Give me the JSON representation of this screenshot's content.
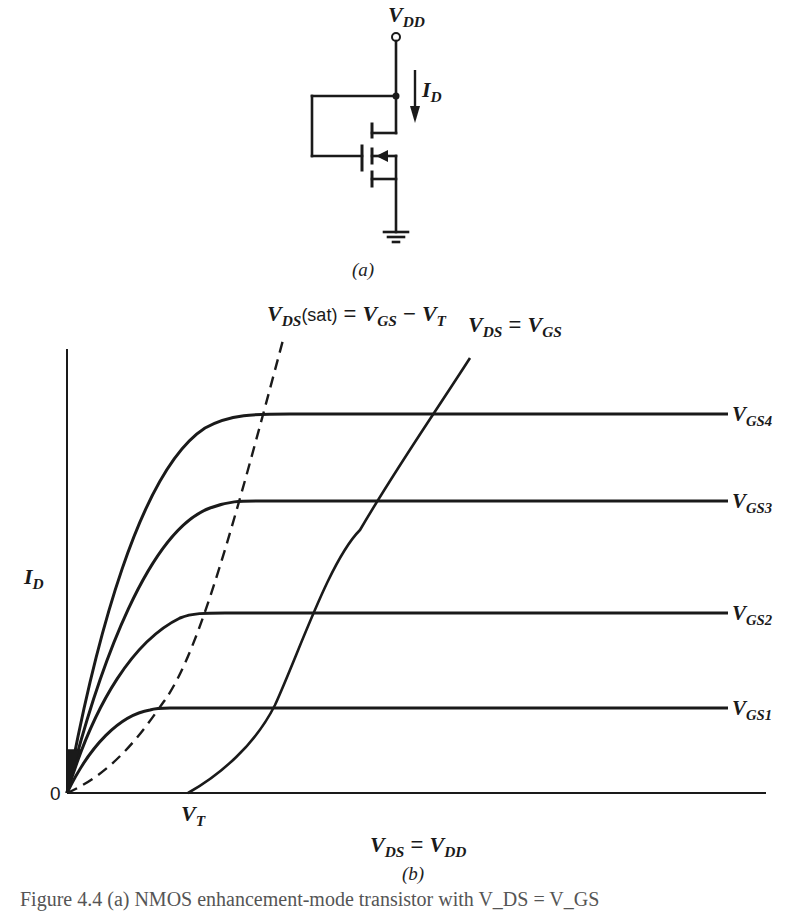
{
  "circuit": {
    "supply_label_main": "V",
    "supply_label_sub": "DD",
    "current_label_main": "I",
    "current_label_sub": "D",
    "caption": "(a)"
  },
  "plot": {
    "sat_label_main": "V",
    "sat_label_sub": "DS",
    "sat_label_paren": "(sat)",
    "sat_label_eq": " = ",
    "sat_label_rhs1_main": "V",
    "sat_label_rhs1_sub": "GS",
    "sat_label_minus": " − ",
    "sat_label_rhs2_main": "V",
    "sat_label_rhs2_sub": "T",
    "diode_label_main": "V",
    "diode_label_sub": "DS",
    "diode_label_eq": " = ",
    "diode_label_rhs_main": "V",
    "diode_label_rhs_sub": "GS",
    "ylabel_main": "I",
    "ylabel_sub": "D",
    "origin_label": "0",
    "vt_label_main": "V",
    "vt_label_sub": "T",
    "xlabel_main": "V",
    "xlabel_sub": "DS",
    "xlabel_eq": " = ",
    "xlabel_rhs_main": "V",
    "xlabel_rhs_sub": "DD",
    "caption": "(b)",
    "curves": [
      {
        "main": "V",
        "sub": "GS4"
      },
      {
        "main": "V",
        "sub": "GS3"
      },
      {
        "main": "V",
        "sub": "GS2"
      },
      {
        "main": "V",
        "sub": "GS1"
      }
    ]
  },
  "figure_caption": "Figure 4.4 (a) NMOS enhancement-mode transistor with V_DS = V_GS"
}
